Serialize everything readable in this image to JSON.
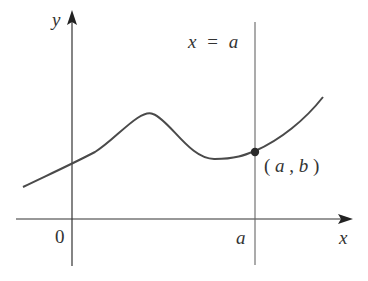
{
  "figure": {
    "axes": {
      "x_label": "x",
      "y_label": "y",
      "origin_label": "0",
      "a_tick_label": "a"
    },
    "vertical_line": {
      "label_lhs": "x",
      "label_eq": "=",
      "label_rhs": "a"
    },
    "point": {
      "label": "(a, b)",
      "label_open": "(",
      "label_a": "a",
      "label_comma": ", ",
      "label_b": "b",
      "label_close": ")"
    },
    "colors": {
      "axis": "#333333",
      "curve": "#4a4a4a",
      "vertical_line": "#666666",
      "point": "#2a2a2a",
      "text": "#333333"
    }
  }
}
